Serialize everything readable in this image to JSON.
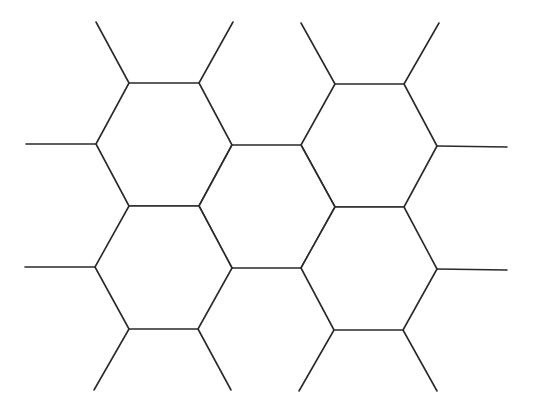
{
  "diagram": {
    "type": "hexagonal-lattice-fragment",
    "colors": {
      "background": "#ffffff",
      "stroke": "#2a2a2a"
    },
    "stroke_width": 1.6,
    "hexagons": [
      {
        "id": "top-left",
        "vertices": [
          [
            129,
            83
          ],
          [
            199,
            83
          ],
          [
            232,
            145
          ],
          [
            199,
            206
          ],
          [
            129,
            206
          ],
          [
            96,
            144
          ]
        ]
      },
      {
        "id": "top-right",
        "vertices": [
          [
            335,
            84
          ],
          [
            404,
            84
          ],
          [
            437,
            146
          ],
          [
            404,
            207
          ],
          [
            335,
            207
          ],
          [
            301,
            145
          ]
        ]
      },
      {
        "id": "center",
        "vertices": [
          [
            232,
            145
          ],
          [
            301,
            145
          ],
          [
            335,
            207
          ],
          [
            301,
            268
          ],
          [
            232,
            268
          ],
          [
            199,
            206
          ]
        ]
      },
      {
        "id": "bottom-left",
        "vertices": [
          [
            129,
            206
          ],
          [
            199,
            206
          ],
          [
            232,
            268
          ],
          [
            198,
            329
          ],
          [
            129,
            329
          ],
          [
            95,
            267
          ]
        ]
      },
      {
        "id": "bottom-right",
        "vertices": [
          [
            335,
            207
          ],
          [
            404,
            207
          ],
          [
            437,
            269
          ],
          [
            403,
            330
          ],
          [
            334,
            330
          ],
          [
            301,
            268
          ]
        ]
      }
    ],
    "dangling_edges": [
      {
        "id": "stub-top-1",
        "from": [
          129,
          83
        ],
        "to": [
          96,
          22
        ]
      },
      {
        "id": "stub-top-2",
        "from": [
          199,
          83
        ],
        "to": [
          233,
          22
        ]
      },
      {
        "id": "stub-top-3",
        "from": [
          335,
          84
        ],
        "to": [
          301,
          23
        ]
      },
      {
        "id": "stub-top-4",
        "from": [
          404,
          84
        ],
        "to": [
          439,
          23
        ]
      },
      {
        "id": "stub-left-1",
        "from": [
          96,
          144
        ],
        "to": [
          26,
          144
        ]
      },
      {
        "id": "stub-left-2",
        "from": [
          95,
          267
        ],
        "to": [
          25,
          267
        ]
      },
      {
        "id": "stub-right-1",
        "from": [
          437,
          146
        ],
        "to": [
          507,
          147
        ]
      },
      {
        "id": "stub-right-2",
        "from": [
          437,
          269
        ],
        "to": [
          507,
          270
        ]
      },
      {
        "id": "stub-bottom-1",
        "from": [
          129,
          329
        ],
        "to": [
          94,
          390
        ]
      },
      {
        "id": "stub-bottom-2",
        "from": [
          198,
          329
        ],
        "to": [
          231,
          390
        ]
      },
      {
        "id": "stub-bottom-3",
        "from": [
          334,
          330
        ],
        "to": [
          299,
          391
        ]
      },
      {
        "id": "stub-bottom-4",
        "from": [
          403,
          330
        ],
        "to": [
          437,
          391
        ]
      }
    ]
  }
}
